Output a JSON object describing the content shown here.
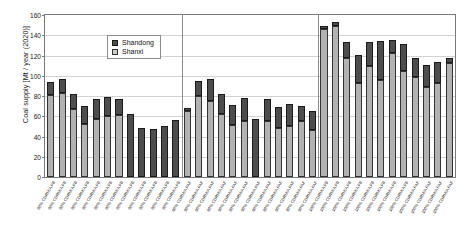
{
  "chart_data": {
    "type": "bar",
    "stacked": true,
    "title": "",
    "xlabel": "",
    "ylabel": "Coal supply [Mt / year (2020)]",
    "ylim": [
      0,
      160
    ],
    "ytick_step": 20,
    "yticks": [
      0,
      20,
      40,
      60,
      80,
      100,
      120,
      140,
      160
    ],
    "grid": true,
    "legend_position": "top-left",
    "legend": [
      "Shandong",
      "Shanxi"
    ],
    "colors": {
      "Shandong": "#4d4d4d",
      "Shanxi": "#b2b2b2"
    },
    "group_separators_after": [
      12,
      24
    ],
    "categories": [
      "80% CDRM/A FB",
      "80% CDRM/A FB",
      "80% CDRM/A FB",
      "80% CDRM/A FB",
      "80% CDRM/A FB",
      "80% CDRM/A FB",
      "80% CDRM/A FB",
      "80% CDRM/A FB",
      "80% CDRM/A FB",
      "80% CDRM/A FB",
      "80% CDRM/A FB",
      "80% CDRM/A FB",
      "80% CDRM/A FAF",
      "80% CDRM/A FAF",
      "80% CDRM/A FAF",
      "80% CDRM/A FAF",
      "80% CDRM/A FAF",
      "80% CDRM/A FAF",
      "80% CDRM/A FAF",
      "80% CDRM/A FAF",
      "80% CDRM/A FAF",
      "80% CDRM/A FAF",
      "80% CDRM/A FAF",
      "80% CDRM/A FAF",
      "100% CDRM/A FB",
      "100% CDRM/A FB",
      "100% CDRM/A FB",
      "100% CDRM/A FB",
      "100% CDRM/A FB",
      "100% CDRM/A FB",
      "100% CDRM/A FB",
      "100% CDRM/A FB",
      "100% CDRM/A FAF",
      "100% CDRM/A FAF",
      "100% CDRM/A FAF",
      "100% CDRM/A FAF"
    ],
    "series": [
      {
        "name": "Shanxi",
        "values": [
          81,
          83,
          67,
          52,
          57,
          60,
          61,
          0,
          0,
          0,
          0,
          0,
          65,
          80,
          75,
          62,
          51,
          55,
          0,
          55,
          48,
          50,
          55,
          46,
          146,
          149,
          118,
          93,
          110,
          96,
          122,
          105,
          99,
          89,
          93,
          113
        ]
      },
      {
        "name": "Shandong",
        "values": [
          13,
          14,
          15,
          18,
          20,
          19,
          16,
          62,
          48,
          47,
          50,
          56,
          3,
          15,
          22,
          20,
          20,
          23,
          57,
          22,
          21,
          22,
          15,
          19,
          3,
          4,
          15,
          28,
          23,
          38,
          13,
          26,
          19,
          22,
          21,
          5
        ]
      }
    ],
    "total_values": [
      94,
      97,
      82,
      70,
      77,
      79,
      77,
      62,
      48,
      47,
      50,
      56,
      68,
      95,
      97,
      82,
      71,
      78,
      57,
      77,
      69,
      72,
      70,
      65,
      149,
      153,
      133,
      121,
      133,
      134,
      135,
      131,
      118,
      111,
      114,
      118
    ]
  },
  "legend": {
    "shandong_label": "Shandong",
    "shanxi_label": "Shanxi"
  },
  "axes": {
    "y_title": "Coal supply [Mt / year (2020)]"
  }
}
